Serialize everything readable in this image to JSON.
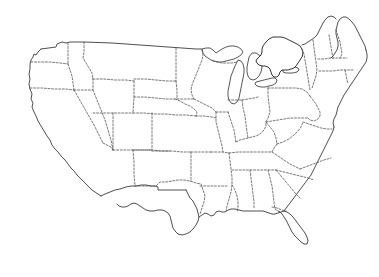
{
  "figure": {
    "type": "choropleth-locator-map",
    "title": "",
    "caption": "",
    "region": "Contiguous United States",
    "projection_note": "",
    "background_color": "#ffffff",
    "outline_color": "#3a3a3a",
    "state_border_color": "#555555",
    "state_border_style": "dotted",
    "highlight_color": "#000000",
    "unhighlighted_color": "#ffffff",
    "marker_color": "#ffffff"
  },
  "highlight": {
    "state_name": "New York",
    "state_abbreviation": "NY",
    "fill": "#000000",
    "label": "",
    "marker": {
      "name": "capital-marker",
      "shape": "square-dot",
      "fill": "#ffffff",
      "x": 284,
      "y": 58
    }
  },
  "legend": {
    "visible": false,
    "entries": []
  },
  "labels": {
    "visible": false,
    "items": []
  },
  "great_lakes": [
    {
      "name": "Lake Superior"
    },
    {
      "name": "Lake Michigan"
    },
    {
      "name": "Lake Huron"
    },
    {
      "name": "Lake Erie"
    },
    {
      "name": "Lake Ontario"
    }
  ],
  "states": [
    {
      "name": "Washington",
      "abbr": "WA",
      "highlighted": false
    },
    {
      "name": "Oregon",
      "abbr": "OR",
      "highlighted": false
    },
    {
      "name": "California",
      "abbr": "CA",
      "highlighted": false
    },
    {
      "name": "Idaho",
      "abbr": "ID",
      "highlighted": false
    },
    {
      "name": "Nevada",
      "abbr": "NV",
      "highlighted": false
    },
    {
      "name": "Montana",
      "abbr": "MT",
      "highlighted": false
    },
    {
      "name": "Wyoming",
      "abbr": "WY",
      "highlighted": false
    },
    {
      "name": "Utah",
      "abbr": "UT",
      "highlighted": false
    },
    {
      "name": "Arizona",
      "abbr": "AZ",
      "highlighted": false
    },
    {
      "name": "Colorado",
      "abbr": "CO",
      "highlighted": false
    },
    {
      "name": "New Mexico",
      "abbr": "NM",
      "highlighted": false
    },
    {
      "name": "North Dakota",
      "abbr": "ND",
      "highlighted": false
    },
    {
      "name": "South Dakota",
      "abbr": "SD",
      "highlighted": false
    },
    {
      "name": "Nebraska",
      "abbr": "NE",
      "highlighted": false
    },
    {
      "name": "Kansas",
      "abbr": "KS",
      "highlighted": false
    },
    {
      "name": "Oklahoma",
      "abbr": "OK",
      "highlighted": false
    },
    {
      "name": "Texas",
      "abbr": "TX",
      "highlighted": false
    },
    {
      "name": "Minnesota",
      "abbr": "MN",
      "highlighted": false
    },
    {
      "name": "Iowa",
      "abbr": "IA",
      "highlighted": false
    },
    {
      "name": "Missouri",
      "abbr": "MO",
      "highlighted": false
    },
    {
      "name": "Arkansas",
      "abbr": "AR",
      "highlighted": false
    },
    {
      "name": "Louisiana",
      "abbr": "LA",
      "highlighted": false
    },
    {
      "name": "Wisconsin",
      "abbr": "WI",
      "highlighted": false
    },
    {
      "name": "Illinois",
      "abbr": "IL",
      "highlighted": false
    },
    {
      "name": "Michigan",
      "abbr": "MI",
      "highlighted": false
    },
    {
      "name": "Indiana",
      "abbr": "IN",
      "highlighted": false
    },
    {
      "name": "Ohio",
      "abbr": "OH",
      "highlighted": false
    },
    {
      "name": "Kentucky",
      "abbr": "KY",
      "highlighted": false
    },
    {
      "name": "Tennessee",
      "abbr": "TN",
      "highlighted": false
    },
    {
      "name": "Mississippi",
      "abbr": "MS",
      "highlighted": false
    },
    {
      "name": "Alabama",
      "abbr": "AL",
      "highlighted": false
    },
    {
      "name": "Georgia",
      "abbr": "GA",
      "highlighted": false
    },
    {
      "name": "Florida",
      "abbr": "FL",
      "highlighted": false
    },
    {
      "name": "South Carolina",
      "abbr": "SC",
      "highlighted": false
    },
    {
      "name": "North Carolina",
      "abbr": "NC",
      "highlighted": false
    },
    {
      "name": "Virginia",
      "abbr": "VA",
      "highlighted": false
    },
    {
      "name": "West Virginia",
      "abbr": "WV",
      "highlighted": false
    },
    {
      "name": "Maryland",
      "abbr": "MD",
      "highlighted": false
    },
    {
      "name": "Delaware",
      "abbr": "DE",
      "highlighted": false
    },
    {
      "name": "Pennsylvania",
      "abbr": "PA",
      "highlighted": false
    },
    {
      "name": "New Jersey",
      "abbr": "NJ",
      "highlighted": false
    },
    {
      "name": "New York",
      "abbr": "NY",
      "highlighted": true
    },
    {
      "name": "Connecticut",
      "abbr": "CT",
      "highlighted": false
    },
    {
      "name": "Rhode Island",
      "abbr": "RI",
      "highlighted": false
    },
    {
      "name": "Massachusetts",
      "abbr": "MA",
      "highlighted": false
    },
    {
      "name": "Vermont",
      "abbr": "VT",
      "highlighted": false
    },
    {
      "name": "New Hampshire",
      "abbr": "NH",
      "highlighted": false
    },
    {
      "name": "Maine",
      "abbr": "ME",
      "highlighted": false
    }
  ]
}
